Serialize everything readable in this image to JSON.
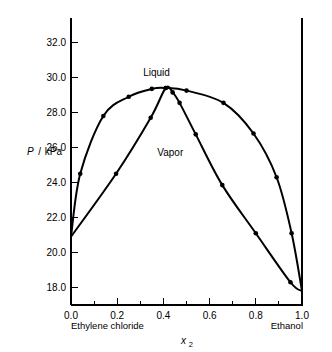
{
  "chart_data": {
    "type": "line",
    "title": "",
    "subtitle": "",
    "xlabel": "x2",
    "ylabel": "P / kPa",
    "xlim": [
      0.0,
      1.0
    ],
    "ylim": [
      17.0,
      33.4
    ],
    "grid": false,
    "legend": "inline-annotations",
    "x_ticks": [
      "0.0",
      "0.2",
      "0.4",
      "0.6",
      "0.8",
      "1.0"
    ],
    "x_tick_values": [
      0.0,
      0.2,
      0.4,
      0.6,
      0.8,
      1.0
    ],
    "x_minor_step": 0.1,
    "y_ticks": [
      "18.0",
      "20.0",
      "22.0",
      "24.0",
      "26.0",
      "28.0",
      "30.0",
      "32.0"
    ],
    "y_tick_values": [
      18.0,
      20.0,
      22.0,
      24.0,
      26.0,
      28.0,
      30.0,
      32.0
    ],
    "x_axis_left_label": "Ethylene chloride",
    "x_axis_right_label": "Ethanol",
    "annotations": [
      {
        "text": "Liquid",
        "x": 0.37,
        "y": 30.1
      },
      {
        "text": "Vapor",
        "x": 0.43,
        "y": 25.5
      }
    ],
    "series": [
      {
        "name": "Liquid",
        "marker": "filled-circle",
        "x": [
          0.0,
          0.04,
          0.14,
          0.25,
          0.35,
          0.41,
          0.5,
          0.66,
          0.79,
          0.89,
          0.955,
          1.0
        ],
        "y": [
          20.9,
          24.5,
          27.8,
          28.9,
          29.35,
          29.4,
          29.25,
          28.55,
          26.8,
          24.3,
          21.1,
          17.8
        ]
      },
      {
        "name": "Vapor",
        "marker": "filled-circle",
        "x": [
          0.0,
          0.195,
          0.345,
          0.41,
          0.44,
          0.47,
          0.54,
          0.655,
          0.8,
          0.95,
          1.0
        ],
        "y": [
          20.9,
          24.5,
          27.7,
          29.4,
          29.15,
          28.55,
          26.75,
          23.85,
          21.1,
          18.3,
          17.8
        ]
      }
    ]
  },
  "axes": {
    "y_axis_caption": "P",
    "y_axis_unit": "kPa",
    "y_axis_separator": "/",
    "x_axis_symbol": "x",
    "x_axis_subscript": "2"
  },
  "colors": {
    "background": "#ffffff",
    "foreground": "#000000",
    "curve": "#000000",
    "marker": "#000000"
  }
}
